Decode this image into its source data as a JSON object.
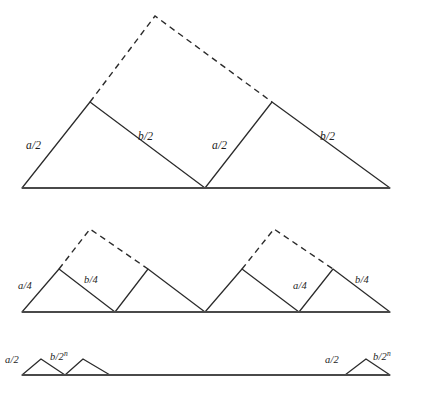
{
  "figure": {
    "background_color": "#ffffff",
    "line_color": "#2b2b2b",
    "baseline_color": "#4a4a4a",
    "width": 421,
    "height": 403
  },
  "rows": [
    {
      "id": "row-1",
      "name": "first-iteration",
      "baseline_y": 188,
      "baseline_x_start": 22,
      "baseline_x_end": 390,
      "labels": [
        {
          "id": "r1-a-left",
          "text": "a/2",
          "sup": "",
          "x": 26,
          "y": 140
        },
        {
          "id": "r1-b-left",
          "text": "b/2",
          "sup": "",
          "x": 138,
          "y": 131
        },
        {
          "id": "r1-a-right",
          "text": "a/2",
          "sup": "",
          "x": 212,
          "y": 140
        },
        {
          "id": "r1-b-right",
          "text": "b/2",
          "sup": "",
          "x": 320,
          "y": 131
        }
      ]
    },
    {
      "id": "row-2",
      "name": "second-iteration",
      "baseline_y": 312,
      "baseline_x_start": 22,
      "baseline_x_end": 390,
      "labels": [
        {
          "id": "r2-a-left",
          "text": "a/4",
          "sup": "",
          "x": 18,
          "y": 281
        },
        {
          "id": "r2-b-left",
          "text": "b/4",
          "sup": "",
          "x": 84,
          "y": 275
        },
        {
          "id": "r2-a-right",
          "text": "a/4",
          "sup": "",
          "x": 293,
          "y": 281
        },
        {
          "id": "r2-b-right",
          "text": "b/4",
          "sup": "",
          "x": 355,
          "y": 275
        }
      ]
    },
    {
      "id": "row-3",
      "name": "nth-iteration",
      "baseline_y": 375,
      "baseline_x_start": 22,
      "baseline_x_end": 390,
      "labels": [
        {
          "id": "r3-a-left",
          "text": "a/2",
          "sup": "",
          "x": 5,
          "y": 355
        },
        {
          "id": "r3-b-left",
          "text": "b/2",
          "sup": "n",
          "x": 50,
          "y": 352
        },
        {
          "id": "r3-a-right",
          "text": "a/2",
          "sup": "",
          "x": 325,
          "y": 355
        },
        {
          "id": "r3-b-right",
          "text": "b/2",
          "sup": "n",
          "x": 373,
          "y": 352
        }
      ]
    }
  ],
  "geometry": {
    "row1": {
      "solid_paths": [
        "M 22 188 L 90 102 L 205 188 L 272 102 L 390 188 L 22 188"
      ],
      "dashed_paths": [
        "M 90 102 L 155 16 L 272 102"
      ]
    },
    "row2": {
      "solid_paths": [
        "M 22 312 L 59 269 L 115 312 L 148 269 L 205 312 L 242 269 L 299 312 L 333 269 L 390 312 L 22 312"
      ],
      "dashed_paths": [
        "M 59 269 L 90 229 L 148 269",
        "M 242 269 L 274 229 L 333 269"
      ]
    },
    "row3": {
      "solid_paths": [
        "M 22 375 L 41 359 L 65 375 L 83 359 L 110 375",
        "M 345 375 L 366 359 L 390 375"
      ],
      "dashed_paths": []
    }
  }
}
